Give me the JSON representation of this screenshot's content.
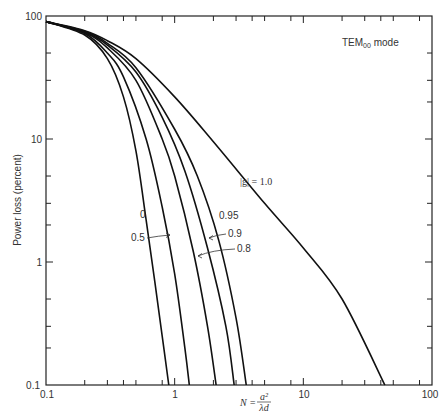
{
  "chart_data": {
    "type": "line",
    "title": "",
    "annotation_mode": "TEM00 mode",
    "xlabel": "N = a^2 / (λd)",
    "ylabel": "Power loss (percent)",
    "xscale": "log",
    "yscale": "log",
    "xlim": [
      0.1,
      100
    ],
    "ylim": [
      0.1,
      100
    ],
    "x_ticks": [
      "0.1",
      "1",
      "10",
      "100"
    ],
    "y_ticks": [
      "0.1",
      "1",
      "10",
      "100"
    ],
    "grid": false,
    "series": [
      {
        "name": "|g| = 0",
        "x": [
          0.1,
          0.2,
          0.3,
          0.4,
          0.5,
          0.6,
          0.7,
          0.8,
          0.9
        ],
        "y": [
          90,
          70,
          45,
          22,
          8,
          2.2,
          0.7,
          0.25,
          0.1
        ]
      },
      {
        "name": "|g| = 0.5",
        "x": [
          0.1,
          0.2,
          0.3,
          0.4,
          0.6,
          0.8,
          1.0,
          1.2,
          1.3
        ],
        "y": [
          90,
          72,
          50,
          32,
          10,
          2.8,
          0.8,
          0.2,
          0.1
        ]
      },
      {
        "name": "|g| = 0.8",
        "x": [
          0.1,
          0.2,
          0.3,
          0.5,
          0.8,
          1.0,
          1.4,
          1.8,
          2.1
        ],
        "y": [
          90,
          73,
          55,
          30,
          10,
          5,
          1.2,
          0.3,
          0.1
        ]
      },
      {
        "name": "|g| = 0.9",
        "x": [
          0.1,
          0.2,
          0.3,
          0.5,
          0.8,
          1.2,
          1.8,
          2.5,
          2.9
        ],
        "y": [
          90,
          74,
          58,
          35,
          15,
          5.5,
          1.3,
          0.3,
          0.1
        ]
      },
      {
        "name": "|g| = 0.95",
        "x": [
          0.1,
          0.2,
          0.3,
          0.5,
          1.0,
          1.5,
          2.2,
          3.0,
          3.6
        ],
        "y": [
          90,
          75,
          60,
          38,
          12,
          5,
          1.5,
          0.35,
          0.1
        ]
      },
      {
        "name": "|g| = 1.0",
        "x": [
          0.1,
          0.2,
          0.3,
          0.5,
          1.0,
          2.0,
          5.0,
          10,
          20,
          43
        ],
        "y": [
          90,
          76,
          63,
          45,
          22,
          9.5,
          3.0,
          1.3,
          0.5,
          0.1
        ]
      }
    ],
    "legend_labels": [
      "0",
      "0.5",
      "0.8",
      "0.9",
      "0.95",
      "|g| = 1.0"
    ]
  },
  "labels": {
    "mode_prefix": "TEM",
    "mode_sub": "00",
    "mode_suffix": " mode",
    "ylabel": "Power loss (percent)",
    "xlabel_N": "N = ",
    "xlabel_num": "a²",
    "xlabel_den": "λd",
    "g_label": "|g| = 1.0",
    "c0": "0",
    "c05": "0.5",
    "c08": "0.8",
    "c09": "0.9",
    "c095": "0.95",
    "x0": "0.1",
    "x1": "1",
    "x2": "10",
    "x3": "100",
    "y0": "0.1",
    "y1": "1",
    "y2": "10",
    "y3": "100"
  }
}
